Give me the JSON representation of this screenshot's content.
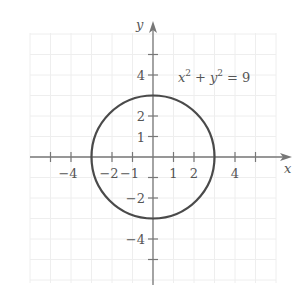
{
  "chart_data": {
    "type": "line",
    "title": "",
    "equation_label": "x² + y² = 9",
    "equation_parts": {
      "x": "x",
      "x_exp": "2",
      "plus": "+",
      "y": "y",
      "y_exp": "2",
      "eq": "= 9"
    },
    "xlabel": "x",
    "ylabel": "y",
    "xlim": [
      -6,
      6.5
    ],
    "ylim": [
      -6.3,
      6.5
    ],
    "grid": true,
    "x_tick_labels": [
      {
        "value": -4,
        "label": "−4"
      },
      {
        "value": -2,
        "label": "−2"
      },
      {
        "value": -1,
        "label": "−1"
      },
      {
        "value": 1,
        "label": "1"
      },
      {
        "value": 2,
        "label": "2"
      },
      {
        "value": 4,
        "label": "4"
      }
    ],
    "y_tick_labels": [
      {
        "value": 4,
        "label": "4"
      },
      {
        "value": 2,
        "label": "2"
      },
      {
        "value": 1,
        "label": "1"
      },
      {
        "value": -2,
        "label": "−2"
      },
      {
        "value": -4,
        "label": "−4"
      }
    ],
    "series": [
      {
        "name": "circle",
        "shape": "circle",
        "center": [
          0,
          0
        ],
        "radius": 3
      }
    ],
    "colors": {
      "curve": "#4a4a4a",
      "axis": "#777777",
      "grid": "#eeeeee",
      "text": "#555555"
    }
  },
  "header": {
    "partial_text": "... y ..."
  }
}
